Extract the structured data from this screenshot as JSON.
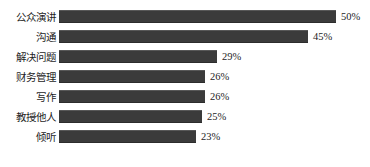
{
  "chart_data": {
    "type": "bar",
    "orientation": "horizontal",
    "title": "",
    "subtitle": "",
    "xlabel": "",
    "ylabel": "",
    "grid": false,
    "legend": false,
    "legend_position": "none",
    "axis_visible": false,
    "tick_labels_x": [],
    "tick_labels_y": [
      "公众演讲",
      "沟通",
      "解决问题",
      "财务管理",
      "写作",
      "教授他人",
      "倾听"
    ],
    "xlim": [
      0,
      50
    ],
    "categories": [
      "公众演讲",
      "沟通",
      "解决问题",
      "财务管理",
      "写作",
      "教授他人",
      "倾听"
    ],
    "values": [
      50,
      45,
      29,
      26,
      26,
      25,
      23
    ],
    "value_labels": [
      "50%",
      "45%",
      "29%",
      "26%",
      "26%",
      "25%",
      "23%"
    ],
    "bar_color": "#3b3b3b",
    "background_color": "#ffffff",
    "text_color": "#1d1d1d"
  },
  "rows": [
    {
      "label": "公众演讲",
      "value": 50,
      "value_label": "50%",
      "bar_px": 277,
      "top_px": 7
    },
    {
      "label": "沟通",
      "value": 45,
      "value_label": "45%",
      "bar_px": 249,
      "top_px": 27
    },
    {
      "label": "解决问题",
      "value": 29,
      "value_label": "29%",
      "bar_px": 158,
      "top_px": 47
    },
    {
      "label": "财务管理",
      "value": 26,
      "value_label": "26%",
      "bar_px": 146,
      "top_px": 67
    },
    {
      "label": "写作",
      "value": 26,
      "value_label": "26%",
      "bar_px": 146,
      "top_px": 87
    },
    {
      "label": "教授他人",
      "value": 25,
      "value_label": "25%",
      "bar_px": 143,
      "top_px": 107
    },
    {
      "label": "倾听",
      "value": 23,
      "value_label": "23%",
      "bar_px": 137,
      "top_px": 127
    }
  ]
}
